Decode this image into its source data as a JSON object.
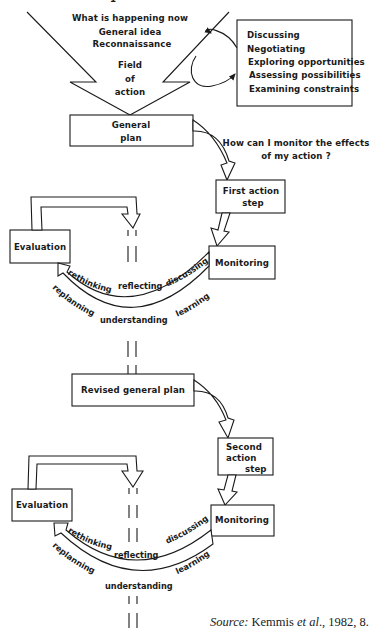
{
  "diagram": {
    "type": "action-research-spiral",
    "top_cut_text": "1",
    "field_of_action": {
      "lines": [
        "What is happening now",
        "General idea",
        "Reconnaissance"
      ],
      "center_label_lines": [
        "Field",
        "of",
        "action"
      ]
    },
    "reconnaissance_box": {
      "items": [
        "Discussing",
        "Negotiating",
        "Exploring opportunities",
        "Assessing possibilities",
        "Examining constraints"
      ]
    },
    "monitor_question": {
      "lines": [
        "How can I monitor the effects",
        "of my action ?"
      ]
    },
    "cycle1": {
      "plan_lines": [
        "General",
        "plan"
      ],
      "action_lines": [
        "First action",
        "step"
      ],
      "monitoring": "Monitoring",
      "evaluation": "Evaluation",
      "inner_arc_words": [
        "rethinking",
        "reflecting",
        "discussing"
      ],
      "outer_arc_words": [
        "replanning",
        "understanding",
        "learning"
      ]
    },
    "cycle2": {
      "plan_lines": [
        "Revised general plan"
      ],
      "action_lines": [
        "Second",
        "action",
        "step"
      ],
      "monitoring": "Monitoring",
      "evaluation": "Evaluation",
      "inner_arc_words": [
        "rethinking",
        "reflecting",
        "discussing"
      ],
      "outer_arc_words": [
        "replanning",
        "understanding",
        "learning"
      ]
    },
    "caption": {
      "source_label": "Source:",
      "authors": "Kemmis",
      "etal": "et al",
      "rest": "., 1982, 8."
    }
  }
}
